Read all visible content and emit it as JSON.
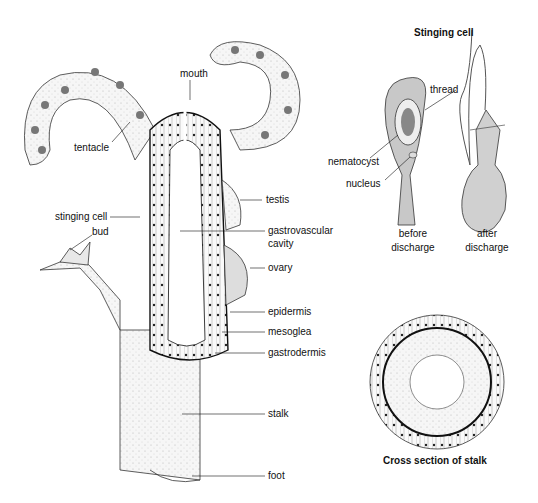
{
  "diagram": {
    "main_labels": {
      "mouth": "mouth",
      "tentacle": "tentacle",
      "testis": "testis",
      "stinging_cell": "stinging cell",
      "gastrovascular_cavity_line1": "gastrovascular",
      "gastrovascular_cavity_line2": "cavity",
      "bud": "bud",
      "ovary": "ovary",
      "epidermis": "epidermis",
      "mesoglea": "mesoglea",
      "gastrodermis": "gastrodermis",
      "stalk": "stalk",
      "foot": "foot"
    },
    "stinging_cell_panel": {
      "title": "Stinging cell",
      "thread": "thread",
      "nematocyst": "nematocyst",
      "nucleus": "nucleus",
      "before_line1": "before",
      "before_line2": "discharge",
      "after_line1": "after",
      "after_line2": "discharge"
    },
    "cross_section_panel": {
      "title": "Cross section of stalk"
    },
    "colors": {
      "ink": "#111111",
      "cell_fill": "#c8c8c8",
      "body_fill": "#f2f2f2"
    }
  }
}
